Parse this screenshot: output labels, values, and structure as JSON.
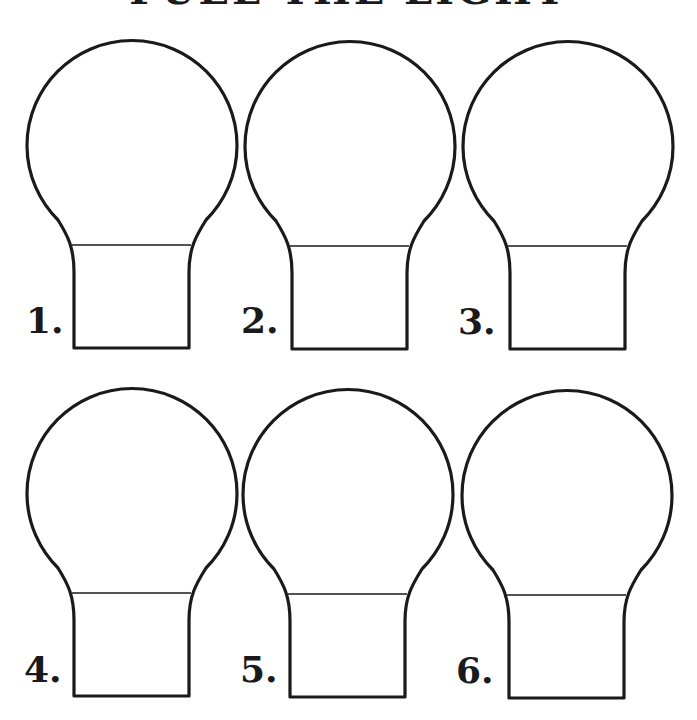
{
  "title": "FUEL THE LIGHT",
  "colors": {
    "ink": "#1a1a1a",
    "paper": "#ffffff"
  },
  "bulbs": [
    {
      "label": "1.",
      "cx": 132,
      "top": 36,
      "label_x": 26,
      "label_y": 302
    },
    {
      "label": "2.",
      "cx": 350,
      "top": 37,
      "label_x": 241,
      "label_y": 302
    },
    {
      "label": "3.",
      "cx": 568,
      "top": 37,
      "label_x": 458,
      "label_y": 303
    },
    {
      "label": "4.",
      "cx": 132,
      "top": 384,
      "label_x": 24,
      "label_y": 651
    },
    {
      "label": "5.",
      "cx": 348,
      "top": 385,
      "label_x": 240,
      "label_y": 651
    },
    {
      "label": "6.",
      "cx": 567,
      "top": 386,
      "label_x": 456,
      "label_y": 652
    }
  ]
}
